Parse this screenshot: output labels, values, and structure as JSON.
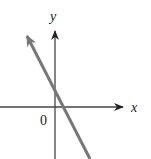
{
  "diagram": {
    "type": "coordinate-graph",
    "axes": {
      "x_label": "x",
      "y_label": "y",
      "origin_label": "0"
    },
    "line": {
      "slope_sign": "negative",
      "y_intercept_sign": "positive",
      "x_intercept_sign": "positive",
      "color": "#777777"
    },
    "colors": {
      "axis": "#333333",
      "line": "#777777",
      "background": "#ffffff"
    }
  }
}
